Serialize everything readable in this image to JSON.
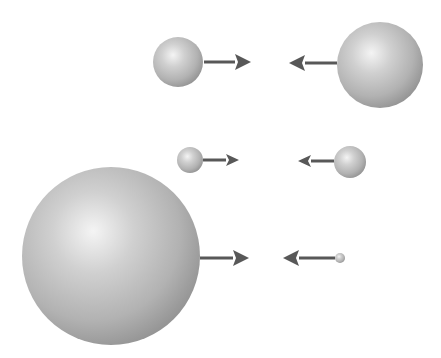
{
  "diagram": {
    "title": "",
    "colors": {
      "background": "#ffffff",
      "arrow": "#585858",
      "sphere_highlight": "#f4f4f4",
      "sphere_mid": "#bdbdbd",
      "sphere_shadow": "#8e8e8e"
    },
    "pairs": [
      {
        "name": "pair-top",
        "left": {
          "cx": 178,
          "cy": 62,
          "r": 25,
          "arrow_from": 204,
          "arrow_to": 251
        },
        "right": {
          "cx": 380,
          "cy": 65,
          "r": 43,
          "arrow_from": 337,
          "arrow_to": 289,
          "arrow_y": 63
        }
      },
      {
        "name": "pair-middle",
        "left": {
          "cx": 190,
          "cy": 160,
          "r": 13,
          "arrow_from": 203,
          "arrow_to": 239
        },
        "right": {
          "cx": 350,
          "cy": 162,
          "r": 16,
          "arrow_from": 334,
          "arrow_to": 298,
          "arrow_y": 161
        }
      },
      {
        "name": "pair-bottom",
        "left": {
          "cx": 111,
          "cy": 256,
          "r": 89,
          "arrow_from": 200,
          "arrow_to": 249,
          "arrow_y": 258
        },
        "right": {
          "cx": 340,
          "cy": 258,
          "r": 5,
          "arrow_from": 335,
          "arrow_to": 283,
          "arrow_y": 258
        }
      }
    ]
  }
}
